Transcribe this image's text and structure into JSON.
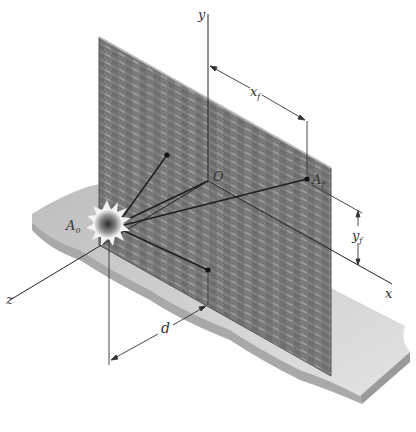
{
  "figure": {
    "axes": {
      "x": "x",
      "y": "y",
      "z": "z"
    },
    "origin_label": "O",
    "points": {
      "source": {
        "label": "A",
        "subscript": "0"
      },
      "target": {
        "label": "A",
        "subscript": "f"
      }
    },
    "dimensions": {
      "horizontal": {
        "label": "x",
        "subscript": "f"
      },
      "vertical": {
        "label": "y",
        "subscript": "f"
      },
      "depth": {
        "label": "d"
      }
    },
    "colors": {
      "wall": "#7a7a7a",
      "wall_light": "#a8a8a8",
      "ground_top": "#d9d9d9",
      "ground_side": "#a9a9a9",
      "lines": "#222222"
    }
  }
}
